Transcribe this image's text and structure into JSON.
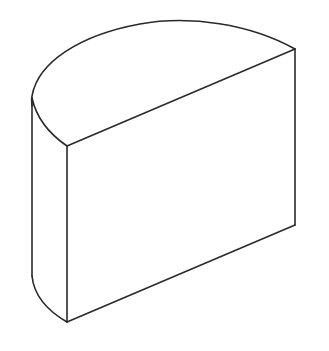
{
  "figure": {
    "stroke_color": "#2a2a2a",
    "background_color": "#ffffff",
    "shape": "half-cylinder",
    "points": {
      "top_back_right": [
        295,
        49
      ],
      "top_front_left": [
        67,
        146
      ],
      "bottom_back_right": [
        295,
        225
      ],
      "bottom_front_left": [
        67,
        322
      ],
      "top_arc_apex": [
        177,
        22
      ],
      "left_silhouette_top": [
        32,
        100
      ],
      "left_silhouette_bottom": [
        32,
        278
      ]
    }
  }
}
